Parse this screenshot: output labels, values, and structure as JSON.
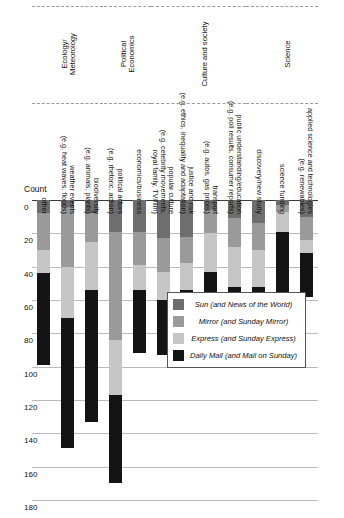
{
  "chart_data": {
    "type": "bar",
    "orientation": "vertical-stacked-rotated",
    "title": "",
    "xlabel": "",
    "ylabel": "Count",
    "ylim": [
      0,
      180
    ],
    "yticks": [
      0,
      20,
      40,
      60,
      80,
      100,
      120,
      140,
      160,
      180
    ],
    "grid": true,
    "legend_position": "upper-left",
    "categories": [
      "applied science and technologies\n(e.g. renewables)",
      "science funding",
      "discovery/new study",
      "public understanding/education\n(e.g. poll results, consumer reports)",
      "transport\n(e.g. autos, gas prices)",
      "justice and risk\n(e.g. ethics, inequality and adaptation)",
      "popular culture\n(e.g. celebrity movements,\nroyal family, TV/film)",
      "economics/business",
      "political actors\n(e.g. rhetoric, action)",
      "biodiversity\n(e.g. animals, plants)",
      "weather events\n(e.g. heat waves, floods)",
      "other"
    ],
    "groups": [
      {
        "label": "Science",
        "categories": 3
      },
      {
        "label": "Culture and society",
        "categories": 4
      },
      {
        "label": "Political\nEconomics",
        "categories": 2
      },
      {
        "label": "Ecology/\nMeteorology",
        "categories": 3
      }
    ],
    "series": [
      {
        "name": "Sun (and News of the World)",
        "color": "#6e6e6e",
        "values": [
          10,
          3,
          14,
          11,
          6,
          22,
          23,
          19,
          19,
          8,
          4,
          8
        ]
      },
      {
        "name": "Mirror (and Sunday Mirror)",
        "color": "#9a9a9a",
        "values": [
          14,
          4,
          16,
          17,
          14,
          16,
          20,
          20,
          65,
          17,
          36,
          22
        ]
      },
      {
        "name": "Express (and Sunday Express)",
        "color": "#c6c6c6",
        "values": [
          8,
          12,
          22,
          24,
          23,
          16,
          17,
          15,
          33,
          29,
          31,
          14
        ]
      },
      {
        "name": "Daily Mail (and Mail on Sunday)",
        "color": "#141414",
        "values": [
          26,
          45,
          12,
          12,
          50,
          39,
          33,
          38,
          53,
          79,
          78,
          55
        ]
      }
    ],
    "totals": [
      58,
      64,
      64,
      64,
      93,
      93,
      93,
      92,
      170,
      133,
      149,
      99
    ]
  },
  "axis": {
    "count_label": "Count",
    "ticks": [
      "0",
      "20",
      "40",
      "60",
      "80",
      "100",
      "120",
      "140",
      "160",
      "180"
    ]
  },
  "legend": {
    "items": [
      {
        "label": "Daily Mail (and Mail on Sunday)",
        "color": "#141414"
      },
      {
        "label": "Express (and Sunday Express)",
        "color": "#c6c6c6"
      },
      {
        "label": "Mirror (and Sunday Mirror)",
        "color": "#9a9a9a"
      },
      {
        "label": "Sun (and News of the World)",
        "color": "#6e6e6e"
      }
    ]
  }
}
